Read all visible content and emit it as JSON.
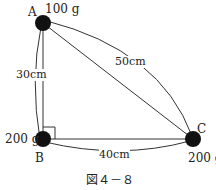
{
  "figure": {
    "caption": "図４－８",
    "points": {
      "A": {
        "label": "A",
        "mass": "100 g"
      },
      "B": {
        "label": "B",
        "mass": "200 g"
      },
      "C": {
        "label": "C",
        "mass": "200 g"
      }
    },
    "distances": {
      "AB": "30cm",
      "BC": "40cm",
      "AC": "50cm"
    },
    "colors": {
      "line": "#333333",
      "ball": "#111111"
    }
  }
}
